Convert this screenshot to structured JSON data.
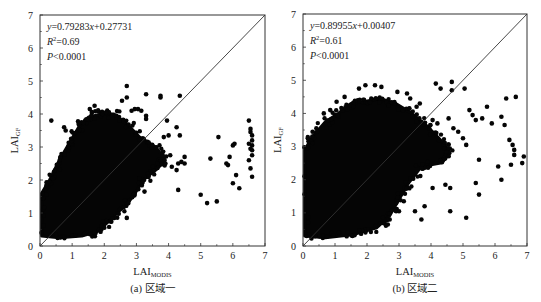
{
  "chart_data": [
    {
      "type": "scatter",
      "panel": "a",
      "caption": "(a) 区域一",
      "title": "",
      "xlabel": "LAI",
      "xlabel_sub": "MODIS",
      "ylabel": "LAI",
      "ylabel_sub": "GF",
      "xlim": [
        0,
        7
      ],
      "ylim": [
        0,
        7
      ],
      "xticks": [
        0,
        1,
        2,
        3,
        4,
        5,
        6,
        7
      ],
      "yticks": [
        0,
        1,
        2,
        3,
        4,
        5,
        6,
        7
      ],
      "grid": false,
      "reference_line": "1:1",
      "annotations": {
        "equation": "y=0.79283x+0.27731",
        "eq_y": "y",
        "eq_mid": "=0.79283",
        "eq_x": "x",
        "eq_end": "+0.27731",
        "r2_label": "R",
        "r2_value": "=0.69",
        "p_label": "P",
        "p_value": "<0.0001"
      },
      "regression": {
        "slope": 0.79283,
        "intercept": 0.27731,
        "r2": 0.69,
        "p": "<0.0001"
      },
      "dense_cloud": [
        [
          0.05,
          0.3
        ],
        [
          0.05,
          1.6
        ],
        [
          0.3,
          2.0
        ],
        [
          0.6,
          2.6
        ],
        [
          0.9,
          3.1
        ],
        [
          1.2,
          3.6
        ],
        [
          1.5,
          3.9
        ],
        [
          1.9,
          4.0
        ],
        [
          2.3,
          4.0
        ],
        [
          2.7,
          3.7
        ],
        [
          3.1,
          3.3
        ],
        [
          3.6,
          3.0
        ],
        [
          3.9,
          2.6
        ],
        [
          3.6,
          2.3
        ],
        [
          3.2,
          2.0
        ],
        [
          2.9,
          1.5
        ],
        [
          2.6,
          1.2
        ],
        [
          2.2,
          0.8
        ],
        [
          1.8,
          0.45
        ],
        [
          1.3,
          0.3
        ],
        [
          0.6,
          0.25
        ]
      ],
      "outliers": [
        [
          0.35,
          3.8
        ],
        [
          0.75,
          3.6
        ],
        [
          0.8,
          3.5
        ],
        [
          1.2,
          3.7
        ],
        [
          1.55,
          4.15
        ],
        [
          1.7,
          4.25
        ],
        [
          1.95,
          4.0
        ],
        [
          2.05,
          4.05
        ],
        [
          2.55,
          4.4
        ],
        [
          2.7,
          4.5
        ],
        [
          2.7,
          4.85
        ],
        [
          2.85,
          4.1
        ],
        [
          2.95,
          4.15
        ],
        [
          3.05,
          4.15
        ],
        [
          3.15,
          4.1
        ],
        [
          3.3,
          4.6
        ],
        [
          3.3,
          3.95
        ],
        [
          3.3,
          3.85
        ],
        [
          3.75,
          4.55
        ],
        [
          3.75,
          4.5
        ],
        [
          3.95,
          3.8
        ],
        [
          3.85,
          3.3
        ],
        [
          4.0,
          3.35
        ],
        [
          4.25,
          3.6
        ],
        [
          4.35,
          3.35
        ],
        [
          4.35,
          4.55
        ],
        [
          3.65,
          2.5
        ],
        [
          3.9,
          2.5
        ],
        [
          4.05,
          2.75
        ],
        [
          4.1,
          2.4
        ],
        [
          4.25,
          2.3
        ],
        [
          4.3,
          2.5
        ],
        [
          4.4,
          2.55
        ],
        [
          4.5,
          2.7
        ],
        [
          4.5,
          2.5
        ],
        [
          4.3,
          1.7
        ],
        [
          3.1,
          2.05
        ],
        [
          3.25,
          1.65
        ],
        [
          2.75,
          1.3
        ],
        [
          2.7,
          0.85
        ],
        [
          5.0,
          1.55
        ],
        [
          5.2,
          1.3
        ],
        [
          5.5,
          1.35
        ],
        [
          5.3,
          2.65
        ],
        [
          5.55,
          3.3
        ],
        [
          5.8,
          2.5
        ],
        [
          5.9,
          2.7
        ],
        [
          6.0,
          3.05
        ],
        [
          6.0,
          1.9
        ],
        [
          6.1,
          2.15
        ],
        [
          6.2,
          1.75
        ],
        [
          6.05,
          3.1
        ],
        [
          5.85,
          2.45
        ],
        [
          6.5,
          3.8
        ],
        [
          6.55,
          3.55
        ],
        [
          6.55,
          3.45
        ],
        [
          6.6,
          3.35
        ],
        [
          6.6,
          3.2
        ],
        [
          6.6,
          3.05
        ],
        [
          6.6,
          2.9
        ],
        [
          6.6,
          2.75
        ],
        [
          6.5,
          2.6
        ],
        [
          6.55,
          2.35
        ],
        [
          6.6,
          2.1
        ],
        [
          6.55,
          2.95
        ],
        [
          6.5,
          3.1
        ],
        [
          0.1,
          1.45
        ],
        [
          0.2,
          1.55
        ],
        [
          0.4,
          2.05
        ],
        [
          0.55,
          2.45
        ],
        [
          2.0,
          0.55
        ]
      ]
    },
    {
      "type": "scatter",
      "panel": "b",
      "caption": "(b) 区域二",
      "title": "",
      "xlabel": "LAI",
      "xlabel_sub": "MODIS",
      "ylabel": "LAI",
      "ylabel_sub": "GF",
      "xlim": [
        0,
        7
      ],
      "ylim": [
        0,
        7
      ],
      "xticks": [
        0,
        1,
        2,
        3,
        4,
        5,
        6,
        7
      ],
      "yticks": [
        0,
        1,
        2,
        3,
        4,
        5,
        6,
        7
      ],
      "grid": false,
      "reference_line": "1:1",
      "annotations": {
        "equation": "y=0.89955x+0.00407",
        "eq_y": "y",
        "eq_mid": "=0.89955",
        "eq_x": "x",
        "eq_end": "+0.00407",
        "r2_label": "R",
        "r2_value": "=0.61",
        "p_label": "P",
        "p_value": "<0.0001"
      },
      "regression": {
        "slope": 0.89955,
        "intercept": 0.00407,
        "r2": 0.61,
        "p": "<0.0001"
      },
      "dense_cloud": [
        [
          0.05,
          0.3
        ],
        [
          0.05,
          2.9
        ],
        [
          0.3,
          3.3
        ],
        [
          0.7,
          3.75
        ],
        [
          1.1,
          4.0
        ],
        [
          1.5,
          4.3
        ],
        [
          1.9,
          4.35
        ],
        [
          2.4,
          4.45
        ],
        [
          2.9,
          4.3
        ],
        [
          3.4,
          4.0
        ],
        [
          3.9,
          3.6
        ],
        [
          4.4,
          3.1
        ],
        [
          4.6,
          2.8
        ],
        [
          4.3,
          2.5
        ],
        [
          3.7,
          2.4
        ],
        [
          3.3,
          1.9
        ],
        [
          3.0,
          1.4
        ],
        [
          2.7,
          0.9
        ],
        [
          2.3,
          0.55
        ],
        [
          1.6,
          0.35
        ],
        [
          0.7,
          0.25
        ]
      ],
      "outliers": [
        [
          0.15,
          3.25
        ],
        [
          0.3,
          3.45
        ],
        [
          0.65,
          4.0
        ],
        [
          0.85,
          4.1
        ],
        [
          1.05,
          4.35
        ],
        [
          1.3,
          4.5
        ],
        [
          1.75,
          4.75
        ],
        [
          1.95,
          4.85
        ],
        [
          2.25,
          4.85
        ],
        [
          2.45,
          4.8
        ],
        [
          2.95,
          4.65
        ],
        [
          3.25,
          4.6
        ],
        [
          3.35,
          4.45
        ],
        [
          3.55,
          4.2
        ],
        [
          3.65,
          4.3
        ],
        [
          4.15,
          4.9
        ],
        [
          4.3,
          4.75
        ],
        [
          4.65,
          4.95
        ],
        [
          4.65,
          4.7
        ],
        [
          5.05,
          4.75
        ],
        [
          4.05,
          3.8
        ],
        [
          4.2,
          3.7
        ],
        [
          4.55,
          3.85
        ],
        [
          4.7,
          3.55
        ],
        [
          4.85,
          3.45
        ],
        [
          5.0,
          3.25
        ],
        [
          5.1,
          3.05
        ],
        [
          5.2,
          4.1
        ],
        [
          5.3,
          3.95
        ],
        [
          5.4,
          3.8
        ],
        [
          5.6,
          3.85
        ],
        [
          5.75,
          4.2
        ],
        [
          5.9,
          3.7
        ],
        [
          6.2,
          3.9
        ],
        [
          6.35,
          4.45
        ],
        [
          6.65,
          4.5
        ],
        [
          6.45,
          3.2
        ],
        [
          6.55,
          3.05
        ],
        [
          6.6,
          2.9
        ],
        [
          6.9,
          2.7
        ],
        [
          6.85,
          2.5
        ],
        [
          6.1,
          2.4
        ],
        [
          6.2,
          2.0
        ],
        [
          5.5,
          2.6
        ],
        [
          5.4,
          1.9
        ],
        [
          5.5,
          1.55
        ],
        [
          4.6,
          1.75
        ],
        [
          4.45,
          1.85
        ],
        [
          4.05,
          1.75
        ],
        [
          3.8,
          1.2
        ],
        [
          3.5,
          1.05
        ],
        [
          3.7,
          0.8
        ],
        [
          4.6,
          1.05
        ],
        [
          5.1,
          0.85
        ],
        [
          3.15,
          1.35
        ],
        [
          3.0,
          1.05
        ],
        [
          2.65,
          0.65
        ],
        [
          6.5,
          2.45
        ],
        [
          6.6,
          2.75
        ],
        [
          6.3,
          3.65
        ]
      ]
    }
  ],
  "figure": {
    "panel_a_caption": "(a) 区域一",
    "panel_b_caption": "(b) 区域二"
  }
}
